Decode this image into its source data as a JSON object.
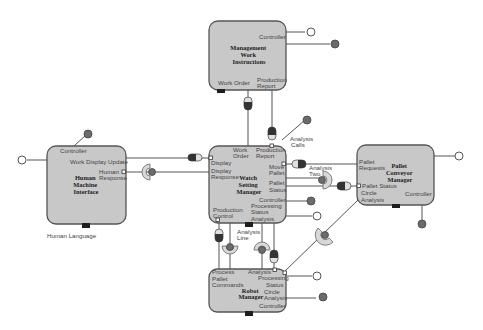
{
  "diagram": {
    "type": "component-interface-diagram",
    "components": [
      {
        "id": "mwi",
        "name": "Management Work Instructions",
        "title_lines": [
          "Management",
          "Work",
          "Instructions"
        ],
        "ports": [
          "Controller",
          "Work Order",
          "Production Report"
        ]
      },
      {
        "id": "hmi",
        "name": "Human Machine Interface",
        "title_lines": [
          "Human",
          "Machine",
          "Interface"
        ],
        "ports": [
          "Controller",
          "Work Display Update",
          "Human Response"
        ],
        "below_label": "Human Language"
      },
      {
        "id": "wsm",
        "name": "Watch Setting Manager",
        "title_lines": [
          "Watch",
          "Setting",
          "Manager"
        ],
        "ports": [
          "Work Order",
          "Production Report",
          "Display",
          "Display Response",
          "Move Pallet",
          "Pallet Status",
          "Controller",
          "Processing Status Analysis",
          "Production Control"
        ]
      },
      {
        "id": "pcm",
        "name": "Pallet Conveyor Manager",
        "title_lines": [
          "Pallet",
          "Conveyor",
          "Manager"
        ],
        "ports": [
          "Pallet Requests",
          "Pallet Status",
          "Circle Analysis",
          "Controller"
        ]
      },
      {
        "id": "rm",
        "name": "Robot Manager",
        "title_lines": [
          "Robot",
          "Manager"
        ],
        "ports": [
          "Process Pallet Commands",
          "Analysis",
          "Processing Status",
          "Circle Analysis",
          "Controller"
        ]
      }
    ],
    "free_labels": {
      "analysis_calls": [
        "Analysis",
        "Calls"
      ],
      "analysis_two": [
        "Analysis",
        "Two"
      ],
      "analysis_line": [
        "Analysis",
        "Line"
      ],
      "human_language": "Human Language"
    },
    "labels": {
      "mwi_controller": "Controller",
      "mwi_work_order": "Work Order",
      "mwi_prod_report": [
        "Production",
        "Report"
      ],
      "hmi_controller": "Controller",
      "hmi_work_display": "Work Display Update",
      "hmi_human_response": [
        "Human",
        "Response"
      ],
      "wsm_work_order": [
        "Work",
        "Order"
      ],
      "wsm_prod_report": [
        "Production",
        "Report"
      ],
      "wsm_display": "Display",
      "wsm_display_response": [
        "Display",
        "Response"
      ],
      "wsm_move_pallet": [
        "Move",
        "Pallet"
      ],
      "wsm_pallet_status": [
        "Pallet",
        "Status"
      ],
      "wsm_controller": "Controller",
      "wsm_processing": [
        "Processing",
        "Status",
        "Analysis"
      ],
      "wsm_prod_control": [
        "Production",
        "Control"
      ],
      "pcm_pallet_requests": [
        "Pallet",
        "Requests"
      ],
      "pcm_pallet_status": "Pallet Status",
      "pcm_circle_analysis": [
        "Circle",
        "Analysis"
      ],
      "pcm_controller": "Controller",
      "rm_process": [
        "Process",
        "Pallet",
        "Commands"
      ],
      "rm_analysis": "Analysis",
      "rm_processing": [
        "Processing",
        "Status"
      ],
      "rm_circle": [
        "Circle",
        "Analysis"
      ],
      "rm_controller": "Controller"
    },
    "colors": {
      "box_fill": "#c8c8c8",
      "box_stroke": "#555555",
      "ball": "#6b6b6b",
      "socket": "#d8d8d8"
    }
  }
}
